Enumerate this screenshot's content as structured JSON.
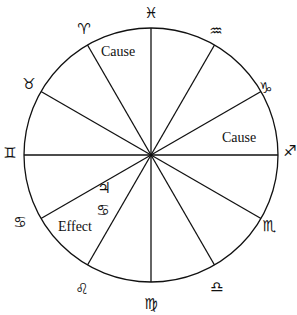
{
  "diagram": {
    "type": "zodiac-wheel",
    "center": [
      151,
      155
    ],
    "radius": 127,
    "line_color": "#111111",
    "signs": [
      {
        "name": "pisces",
        "glyph": "♓",
        "x": 151,
        "y": 13
      },
      {
        "name": "aquarius",
        "glyph": "♒",
        "x": 216,
        "y": 31
      },
      {
        "name": "capricorn",
        "glyph": "♑",
        "x": 266,
        "y": 88
      },
      {
        "name": "sagittarius",
        "glyph": "♐",
        "x": 290,
        "y": 151
      },
      {
        "name": "scorpio",
        "glyph": "♏",
        "x": 269,
        "y": 226
      },
      {
        "name": "libra",
        "glyph": "♎",
        "x": 217,
        "y": 287
      },
      {
        "name": "virgo",
        "glyph": "♍",
        "x": 151,
        "y": 304
      },
      {
        "name": "leo",
        "glyph": "♌",
        "x": 82,
        "y": 289
      },
      {
        "name": "cancer",
        "glyph": "♋",
        "x": 20,
        "y": 222
      },
      {
        "name": "gemini",
        "glyph": "♊",
        "x": 10,
        "y": 153
      },
      {
        "name": "taurus",
        "glyph": "♉",
        "x": 29,
        "y": 84
      },
      {
        "name": "aries",
        "glyph": "♈",
        "x": 84,
        "y": 29
      }
    ],
    "labels": [
      {
        "name": "cause-top",
        "text": "Cause",
        "x": 118,
        "y": 51
      },
      {
        "name": "cause-right",
        "text": "Cause",
        "x": 239,
        "y": 137
      },
      {
        "name": "effect",
        "text": "Effect",
        "x": 75,
        "y": 226
      }
    ],
    "inner_glyphs": [
      {
        "name": "jupiter",
        "glyph": "♃",
        "x": 104,
        "y": 188
      },
      {
        "name": "cancer-inner",
        "glyph": "♋",
        "x": 103,
        "y": 210
      }
    ]
  }
}
